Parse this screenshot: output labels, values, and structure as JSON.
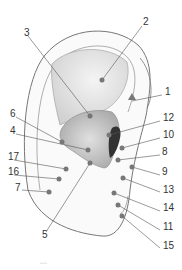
{
  "figure": {
    "labels": [
      {
        "n": "1",
        "x": 165,
        "y": 92
      },
      {
        "n": "2",
        "x": 143,
        "y": 22
      },
      {
        "n": "3",
        "x": 24,
        "y": 33
      },
      {
        "n": "4",
        "x": 10,
        "y": 131
      },
      {
        "n": "5",
        "x": 42,
        "y": 235
      },
      {
        "n": "6",
        "x": 10,
        "y": 114
      },
      {
        "n": "7",
        "x": 15,
        "y": 188
      },
      {
        "n": "8",
        "x": 162,
        "y": 152
      },
      {
        "n": "9",
        "x": 162,
        "y": 172
      },
      {
        "n": "10",
        "x": 163,
        "y": 135
      },
      {
        "n": "11",
        "x": 163,
        "y": 227
      },
      {
        "n": "12",
        "x": 163,
        "y": 118
      },
      {
        "n": "13",
        "x": 163,
        "y": 190
      },
      {
        "n": "14",
        "x": 163,
        "y": 208
      },
      {
        "n": "15",
        "x": 163,
        "y": 246
      },
      {
        "n": "16",
        "x": 8,
        "y": 172
      },
      {
        "n": "17",
        "x": 8,
        "y": 157
      }
    ],
    "footer_text": "••••"
  }
}
